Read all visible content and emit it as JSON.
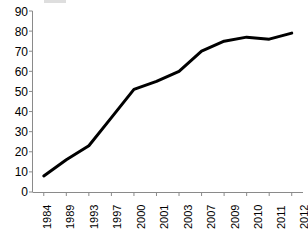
{
  "chart_data": {
    "type": "line",
    "title": "",
    "subtitle": "",
    "xlabel": "",
    "ylabel": "",
    "categories": [
      "1984",
      "1989",
      "1993",
      "1997",
      "2000",
      "2001",
      "2003",
      "2007",
      "2009",
      "2010",
      "2011",
      "2012"
    ],
    "values": [
      8,
      16,
      23,
      37,
      51,
      55,
      60,
      70,
      75,
      77,
      76,
      79
    ],
    "series": [
      {
        "name": "",
        "values": [
          8,
          16,
          23,
          37,
          51,
          55,
          60,
          70,
          75,
          77,
          76,
          79
        ],
        "color": "#000000"
      }
    ],
    "ylim": [
      0,
      90
    ],
    "ytick_labels": [
      "90",
      "80",
      "70",
      "60",
      "50",
      "40",
      "30",
      "20",
      "10",
      "0"
    ],
    "ytick_values": [
      90,
      80,
      70,
      60,
      50,
      40,
      30,
      20,
      10,
      0
    ],
    "ytick_step": 10,
    "grid": false,
    "legend": "none",
    "legend_position": "none",
    "line_color": "#000000",
    "line_width": 3,
    "axis_color": "#808080",
    "background_color": "#ffffff",
    "markers": false,
    "annotations": []
  },
  "axes": {
    "y_axis_name": "y-axis",
    "x_axis_name": "x-axis"
  }
}
